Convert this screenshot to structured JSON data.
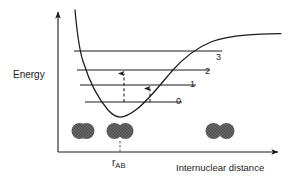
{
  "figure": {
    "kind": "morse-potential-energy-diagram",
    "background": "#ffffff",
    "ink": "#1a1a1a",
    "atom_fill": "#6e6e6e",
    "width": 290,
    "height": 184
  },
  "axes": {
    "y_label": "Energy",
    "x_label": "Internuclear distance",
    "origin": {
      "x": 58,
      "y": 152
    },
    "y_top": {
      "x": 58,
      "y": 10
    },
    "x_right": {
      "x": 281,
      "y": 152
    },
    "arrowheads": [
      "y-top",
      "x-right"
    ],
    "ticks": "none",
    "grid": false
  },
  "equilibrium": {
    "label": "r",
    "subscript": "AB",
    "x": 120,
    "tick_from_y": 140,
    "tick_to_y": 152
  },
  "curve": {
    "name": "potential-energy-curve",
    "minimum": {
      "x": 120,
      "y": 117
    },
    "asymptote_y": 35,
    "repulsive_wall_x": 72,
    "points": [
      [
        75,
        10
      ],
      [
        78,
        30
      ],
      [
        81,
        48
      ],
      [
        84,
        62
      ],
      [
        88,
        76
      ],
      [
        92,
        87
      ],
      [
        97,
        97
      ],
      [
        103,
        106
      ],
      [
        110,
        113
      ],
      [
        116,
        116
      ],
      [
        120,
        117
      ],
      [
        126,
        116
      ],
      [
        133,
        112
      ],
      [
        142,
        104
      ],
      [
        151,
        94
      ],
      [
        160,
        83
      ],
      [
        170,
        72
      ],
      [
        180,
        62
      ],
      [
        190,
        54
      ],
      [
        200,
        48
      ],
      [
        212,
        42
      ],
      [
        225,
        38
      ],
      [
        240,
        36
      ],
      [
        258,
        35
      ],
      [
        281,
        34
      ]
    ]
  },
  "vibrational_levels": [
    {
      "label": "0",
      "y": 102,
      "x_start": 85,
      "x_end": 182
    },
    {
      "label": "1",
      "y": 85,
      "x_start": 80,
      "x_end": 196
    },
    {
      "label": "2",
      "y": 70,
      "x_start": 77,
      "x_end": 210
    },
    {
      "label": "3",
      "y": 51,
      "x_start": 74,
      "x_end": 222
    }
  ],
  "transitions": [
    {
      "name": "transition-0-to-2",
      "x": 124,
      "y_from": 102,
      "y_to": 70,
      "style": "dashed",
      "arrow": "up"
    },
    {
      "name": "transition-0-to-1",
      "x": 150,
      "y_from": 102,
      "y_to": 85,
      "style": "dashed",
      "arrow": "up"
    }
  ],
  "molecules": [
    {
      "name": "molecule-compressed",
      "cx": 83,
      "cy": 131,
      "atom_r": 8,
      "separation": 7,
      "note": "atoms strongly overlapping"
    },
    {
      "name": "molecule-equilibrium",
      "cx": 120,
      "cy": 131,
      "atom_r": 8,
      "separation": 11,
      "note": "atoms at equilibrium bond length"
    },
    {
      "name": "molecule-stretched",
      "cx": 220,
      "cy": 131,
      "atom_r": 8,
      "separation": 13,
      "note": "atoms stretched apart"
    }
  ]
}
